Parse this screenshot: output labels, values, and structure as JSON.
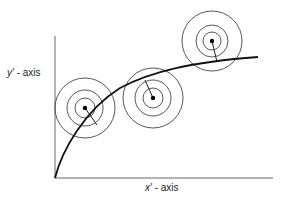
{
  "diagram": {
    "y_axis_label": {
      "var": "y′",
      "text": " - axis"
    },
    "x_axis_label": {
      "var": "x′",
      "text": " - axis"
    },
    "colors": {
      "stroke": "#222222",
      "axis": "#555555",
      "circle": "#444444"
    },
    "axes": {
      "origin": [
        55,
        178
      ],
      "x_end": 273,
      "y_top": 36
    },
    "curve_path": "M55,178 C62,150 85,110 120,88 C150,72 190,62 258,57",
    "targets": [
      {
        "cx": 85,
        "cy": 108,
        "radii": [
          30,
          18,
          10
        ],
        "foot": [
          97,
          125
        ]
      },
      {
        "cx": 153,
        "cy": 98,
        "radii": [
          30,
          18,
          10
        ],
        "foot": [
          145,
          80
        ]
      },
      {
        "cx": 212,
        "cy": 41,
        "radii": [
          30,
          16,
          9
        ],
        "foot": [
          217,
          62
        ]
      }
    ]
  }
}
